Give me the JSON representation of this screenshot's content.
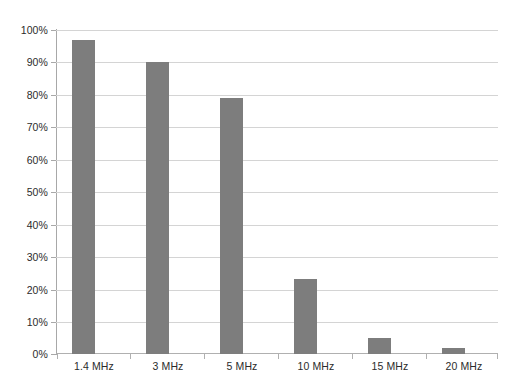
{
  "chart_data": {
    "type": "bar",
    "title": "",
    "subtitle": "",
    "xlabel": "",
    "ylabel": "",
    "categories": [
      "1.4 MHz",
      "3 MHz",
      "5 MHz",
      "10 MHz",
      "15 MHz",
      "20 MHz"
    ],
    "values": [
      97,
      90,
      79,
      23,
      5,
      2
    ],
    "value_labels": [
      "97%",
      "90%",
      "79%",
      "23%",
      "5%",
      "2%"
    ],
    "series": [
      {
        "name": "",
        "values": [
          97,
          90,
          79,
          23,
          5,
          2
        ],
        "color": "#7d7d7d"
      }
    ],
    "ylim": [
      0,
      100
    ],
    "y_ticks": [
      0,
      10,
      20,
      30,
      40,
      50,
      60,
      70,
      80,
      90,
      100
    ],
    "y_tick_labels": [
      "0%",
      "10%",
      "20%",
      "30%",
      "40%",
      "50%",
      "60%",
      "70%",
      "80%",
      "90%",
      "100%"
    ],
    "grid": true,
    "grid_axis": "y",
    "legend": false,
    "legend_position": "none",
    "annotations": [],
    "colors": {
      "bar": "#7d7d7d",
      "gridline": "#d4d4d4",
      "axis": "#a8a8a8",
      "baseline": "#b0b0b0",
      "text": "#2b2b2b",
      "background": "#ffffff"
    }
  }
}
